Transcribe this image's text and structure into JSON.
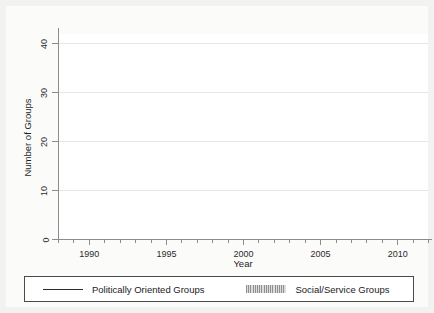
{
  "chart_data": {
    "type": "line",
    "title": "",
    "xlabel": "Year",
    "ylabel": "Number of Groups",
    "xlim": [
      1988,
      2012
    ],
    "ylim": [
      0,
      42
    ],
    "yticks": [
      0,
      10,
      20,
      30,
      40
    ],
    "xticks": [
      1990,
      1995,
      2000,
      2005,
      2010
    ],
    "xtick_minor_step": 1,
    "grid": true,
    "grid_axis": "y",
    "legend_position": "bottom",
    "step_type": "post",
    "series": [
      {
        "name": "Politically Oriented Groups",
        "style": "line",
        "color": "#2b2b2b",
        "x": [
          1988,
          1989,
          1990,
          1991,
          1992,
          1993,
          1994,
          1995,
          1996,
          1997,
          1998,
          1999,
          2000,
          2001,
          2002,
          2003,
          2004,
          2005,
          2006,
          2007,
          2008,
          2009,
          2010,
          2011,
          2012
        ],
        "values": [
          0,
          0,
          1,
          2,
          36,
          39,
          38,
          38,
          38,
          38.5,
          39,
          39,
          41,
          3.5,
          3.5,
          4.5,
          6.5,
          6.5,
          6.5,
          6.5,
          4.5,
          4.5,
          5.5,
          6.5,
          7.5
        ]
      },
      {
        "name": "Social/Service Groups",
        "style": "hatched-band",
        "color": "#b0b0b0",
        "x": [
          1988,
          1989,
          1990,
          1991,
          1992,
          1993,
          1994,
          1995,
          1996,
          1997,
          1998,
          1999,
          2000,
          2001,
          2002,
          2003,
          2004,
          2005,
          2006,
          2007,
          2008,
          2009,
          2010,
          2011,
          2012
        ],
        "values": [
          2,
          3,
          3,
          2,
          0,
          0,
          0,
          0,
          0,
          0,
          0,
          0,
          0,
          36,
          36,
          36,
          36,
          36,
          36,
          36,
          36,
          37,
          37,
          37,
          37
        ]
      }
    ]
  },
  "axes": {
    "ylabel": "Number of Groups",
    "xlabel": "Year",
    "ytick_labels": [
      "0",
      "10",
      "20",
      "30",
      "40"
    ],
    "xtick_labels": [
      "1990",
      "1995",
      "2000",
      "2005",
      "2010"
    ]
  },
  "legend": {
    "entries": [
      {
        "label": "Politically Oriented Groups",
        "key": "solid-line-key"
      },
      {
        "label": "Social/Service Groups",
        "key": "hatched-band-key"
      }
    ]
  }
}
